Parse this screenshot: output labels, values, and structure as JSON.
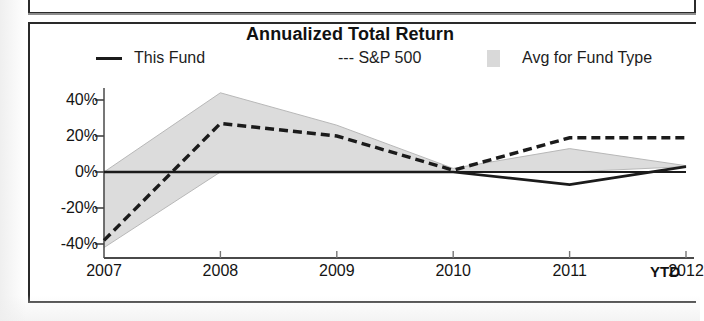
{
  "panel": {
    "title": "Annualized Total Return"
  },
  "legend": {
    "items": [
      {
        "label": "This Fund",
        "marker": "solid-line-swatch",
        "color": "#1b1b1b"
      },
      {
        "label": "--- S&P 500",
        "marker": "dashed-line-swatch",
        "color": "#1b1b1b"
      },
      {
        "label": "Avg for Fund Type",
        "marker": "gray-box-swatch",
        "color": "#d9d9d9"
      }
    ]
  },
  "axis": {
    "x_suffix_label": "YTD",
    "y_ticks": [
      "40%",
      "20%",
      "0%",
      "-20%",
      "-40%"
    ],
    "x_ticks": [
      "2007",
      "2008",
      "2009",
      "2010",
      "2011",
      "2012"
    ]
  },
  "chart_data": {
    "type": "line",
    "title": "Annualized Total Return",
    "xlabel": "",
    "ylabel": "",
    "categories": [
      "2007",
      "2008",
      "2009",
      "2010",
      "2011",
      "2012"
    ],
    "x_axis_note": "2012 YTD",
    "ylim": [
      -48,
      48
    ],
    "ytick_values": [
      40,
      20,
      0,
      -20,
      -40
    ],
    "ytick_labels": [
      "40%",
      "20%",
      "0%",
      "-20%",
      "-40%"
    ],
    "grid": false,
    "legend_position": "top",
    "series": [
      {
        "name": "This Fund",
        "style": "solid",
        "color": "#1b1b1b",
        "values": [
          0,
          0,
          0,
          0,
          -7,
          3
        ]
      },
      {
        "name": "S&P 500",
        "style": "dashed",
        "color": "#1b1b1b",
        "values": [
          -38,
          27,
          20,
          1,
          19,
          19
        ]
      }
    ],
    "band": {
      "name": "Avg for Fund Type",
      "type": "area",
      "fill": "#dcdcdc",
      "upper": [
        0,
        44,
        26,
        2,
        13,
        3.5
      ],
      "lower": [
        -42,
        0,
        0,
        0,
        0,
        3
      ]
    }
  }
}
